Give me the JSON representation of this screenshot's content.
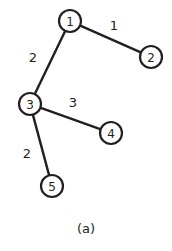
{
  "figure": {
    "caption": "(a)",
    "caption_x": 86,
    "caption_y": 228,
    "width": 172,
    "height": 251,
    "background": "#ffffff",
    "ink_color": "#231f20"
  },
  "chart_data": {
    "type": "diagram",
    "diagram_kind": "undirected-weighted-graph",
    "title": "(a)",
    "node_radius": 11,
    "nodes": [
      {
        "id": "1",
        "label": "1",
        "x": 70,
        "y": 21
      },
      {
        "id": "2",
        "label": "2",
        "x": 151,
        "y": 57
      },
      {
        "id": "3",
        "label": "3",
        "x": 30,
        "y": 104
      },
      {
        "id": "4",
        "label": "4",
        "x": 111,
        "y": 133
      },
      {
        "id": "5",
        "label": "5",
        "x": 52,
        "y": 186
      }
    ],
    "edges": [
      {
        "id": "e12",
        "source": "1",
        "target": "2",
        "weight": "1",
        "label_x": 114,
        "label_y": 25
      },
      {
        "id": "e13",
        "source": "1",
        "target": "3",
        "weight": "2",
        "label_x": 33,
        "label_y": 57
      },
      {
        "id": "e34",
        "source": "3",
        "target": "4",
        "weight": "3",
        "label_x": 73,
        "label_y": 102
      },
      {
        "id": "e35",
        "source": "3",
        "target": "5",
        "weight": "2",
        "label_x": 27,
        "label_y": 153
      }
    ]
  }
}
